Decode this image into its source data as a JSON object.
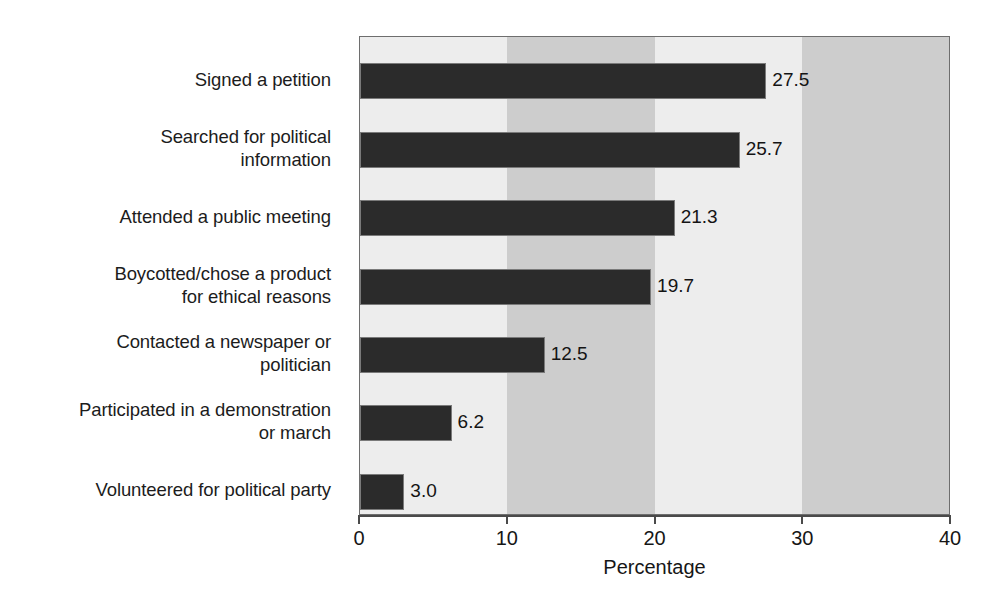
{
  "chart_data": {
    "type": "bar",
    "orientation": "horizontal",
    "title": "",
    "xlabel": "Percentage",
    "ylabel": "",
    "xlim": [
      0,
      40
    ],
    "xticks": [
      0,
      10,
      20,
      30,
      40
    ],
    "xtick_labels": [
      "0",
      "10",
      "20",
      "30",
      "40"
    ],
    "grid": false,
    "legend": null,
    "band_shading": {
      "description": "alternating vertical background bands every 10 units",
      "light": "#ededed",
      "dark": "#cdcdcd"
    },
    "bar_color": "#2b2b2b",
    "bar_edge_color": "#7a7a7a",
    "categories": [
      "Signed a petition",
      "Searched for political information",
      "Attended a public meeting",
      "Boycotted/chose a product for ethical reasons",
      "Contacted a newspaper or politician",
      "Participated in a demonstration or march",
      "Volunteered for political party"
    ],
    "values": [
      27.5,
      25.7,
      21.3,
      19.7,
      12.5,
      6.2,
      3.0
    ],
    "value_labels": [
      "27.5",
      "25.7",
      "21.3",
      "19.7",
      "12.5",
      "6.2",
      "3.0"
    ]
  },
  "axis": {
    "x_title": "Percentage",
    "tick_labels": [
      "0",
      "10",
      "20",
      "30",
      "40"
    ]
  },
  "categories": [
    {
      "lines": [
        "Signed a petition"
      ],
      "value_label": "27.5"
    },
    {
      "lines": [
        "Searched for political",
        "information"
      ],
      "value_label": "25.7"
    },
    {
      "lines": [
        "Attended a public meeting"
      ],
      "value_label": "21.3"
    },
    {
      "lines": [
        "Boycotted/chose a product",
        "for ethical reasons"
      ],
      "value_label": "19.7"
    },
    {
      "lines": [
        "Contacted a newspaper or",
        "politician"
      ],
      "value_label": "12.5"
    },
    {
      "lines": [
        "Participated in a demonstration",
        "or march"
      ],
      "value_label": "6.2"
    },
    {
      "lines": [
        "Volunteered for political party"
      ],
      "value_label": "3.0"
    }
  ],
  "caption": ""
}
